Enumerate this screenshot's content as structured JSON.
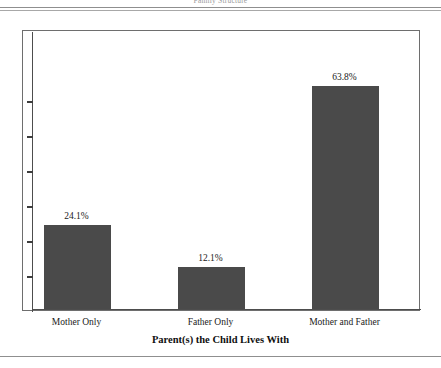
{
  "page": {
    "caption": "Family Structure"
  },
  "chart_data": {
    "type": "bar",
    "title": "Family Structure",
    "xlabel": "Parent(s) the Child Lives With",
    "ylabel": "",
    "categories": [
      "Mother Only",
      "Father Only",
      "Mother and Father"
    ],
    "values": [
      24.1,
      12.1,
      63.8
    ],
    "value_labels": [
      "24.1%",
      "12.1%",
      "63.8%"
    ],
    "ylim": [
      0,
      80
    ],
    "y_tick_values": [
      10,
      20,
      30,
      40,
      50,
      60
    ],
    "y_tick_labels": [
      "",
      "",
      "",
      "",
      "",
      ""
    ],
    "grid": false,
    "legend": false,
    "bar_color": "#4a4a4a",
    "axis_color": "#4d4d4d",
    "frame_color": "#6e6e6e"
  }
}
